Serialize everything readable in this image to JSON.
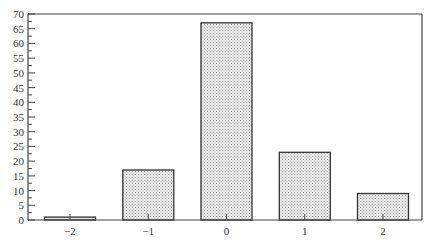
{
  "chart_data": {
    "type": "bar",
    "title": "",
    "xlabel": "",
    "ylabel": "",
    "categories": [
      "−2",
      "−1",
      "0",
      "1",
      "2"
    ],
    "values": [
      1,
      17,
      67,
      23,
      9
    ],
    "ylim": [
      0,
      70
    ],
    "yticks": [
      0,
      5,
      10,
      15,
      20,
      25,
      30,
      35,
      40,
      45,
      50,
      55,
      60,
      65,
      70
    ],
    "yminor_step": 2.5,
    "grid": false,
    "legend": null,
    "bar_fill": "#e6e6e6",
    "bar_stipple": "#9a9a9a",
    "bar_edge": "#333333",
    "axis_color": "#444444"
  }
}
